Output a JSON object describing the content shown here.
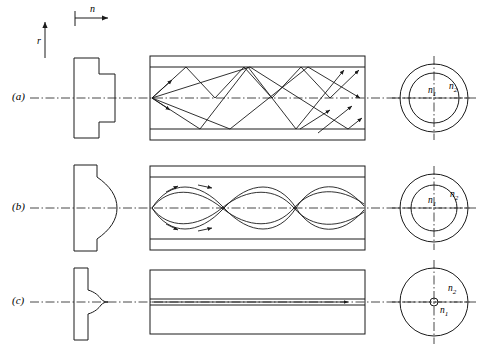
{
  "figure": {
    "axes": {
      "vertical_label": "r",
      "horizontal_label": "n"
    },
    "stroke_color": "#1a1a1a",
    "rows": [
      {
        "key": "a",
        "row_label": "(a)",
        "profile_type": "step-index",
        "ray_type": "zigzag-multimode",
        "cross_section": {
          "core_label": "n",
          "core_sub": "1",
          "clad_label": "n",
          "clad_sub": "2",
          "core_relative_radius": 0.72
        }
      },
      {
        "key": "b",
        "row_label": "(b)",
        "profile_type": "graded-index-parabolic",
        "ray_type": "sinusoidal-multimode",
        "cross_section": {
          "core_label": "n",
          "core_sub": "1",
          "clad_label": "n",
          "clad_sub": "2",
          "core_relative_radius": 0.66
        }
      },
      {
        "key": "c",
        "row_label": "(c)",
        "profile_type": "single-mode-spike",
        "ray_type": "straight-axial",
        "cross_section": {
          "core_label": "n",
          "core_sub": "1",
          "clad_label": "n",
          "clad_sub": "2",
          "core_relative_radius": 0.07
        }
      }
    ]
  }
}
